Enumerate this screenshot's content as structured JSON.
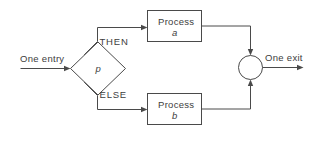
{
  "diagram": {
    "type": "flowchart",
    "background_color": "#ffffff",
    "line_color": "#4a4a4a",
    "text_color": "#3d3d3d",
    "entry": {
      "label": "One entry"
    },
    "exit": {
      "label": "One exit"
    },
    "decision": {
      "label": "p",
      "shape": "diamond"
    },
    "branches": {
      "then_label": "THEN",
      "else_label": "ELSE"
    },
    "process_top": {
      "line1": "Process",
      "line2": "a",
      "shape": "rectangle"
    },
    "process_bottom": {
      "line1": "Process",
      "line2": "b",
      "shape": "rectangle"
    },
    "junction": {
      "shape": "circle"
    }
  }
}
